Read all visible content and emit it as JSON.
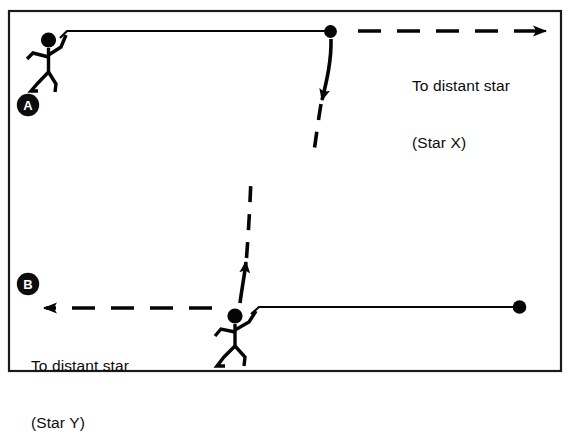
{
  "diagram": {
    "background_color": "#ffffff",
    "ink_color": "#050505",
    "frame": {
      "name": "outer-border",
      "x": 8,
      "y": 10,
      "width": 554,
      "height": 362,
      "stroke": "#1a1a1a"
    },
    "panels": [
      {
        "id": "A",
        "badge_label": "A",
        "badge_text_color": "#ffffff",
        "badge_fill": "#0d0d0d",
        "badge_x": 28,
        "badge_y": 104,
        "caption_lines": [
          "To distant star",
          "(Star X)"
        ],
        "arrow_direction": "right",
        "observer_position": "left",
        "source_dot_x": 330,
        "source_dot_y": 32
      },
      {
        "id": "B",
        "badge_label": "B",
        "badge_text_color": "#ffffff",
        "badge_fill": "#0d0d0d",
        "badge_x": 28,
        "badge_y": 283,
        "caption_lines": [
          "To distant star",
          "(Star Y)"
        ],
        "arrow_direction": "left",
        "observer_position": "right",
        "source_dot_x": 519,
        "source_dot_y": 307
      }
    ],
    "captions": {
      "star_x": {
        "line1": "To distant star",
        "line2": "(Star X)"
      },
      "star_y": {
        "line1": "To distant star",
        "line2": "(Star Y)"
      }
    },
    "labels": {
      "badge_a": "A",
      "badge_b": "B"
    },
    "rays": [
      {
        "name": "upper-dashed-beam-down",
        "style": "dashed",
        "direction": "down",
        "from": [
          331,
          38
        ],
        "to": [
          313,
          155
        ]
      },
      {
        "name": "lower-dashed-beam-up",
        "style": "dashed",
        "direction": "up",
        "from": [
          240,
          303
        ],
        "to": [
          250,
          178
        ]
      },
      {
        "name": "upper-dashed-arrow-right",
        "style": "dashed",
        "direction": "right",
        "from": [
          358,
          31
        ],
        "to": [
          560,
          31
        ]
      },
      {
        "name": "lower-dashed-arrow-left",
        "style": "dashed",
        "direction": "left",
        "from": [
          212,
          308
        ],
        "to": [
          30,
          308
        ]
      }
    ]
  }
}
